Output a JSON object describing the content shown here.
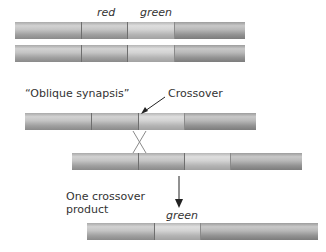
{
  "labels": {
    "red": "red",
    "green_top": "green",
    "oblique_synapsis": "“Oblique synapsis”",
    "crossover": "Crossover",
    "one_crossover_product_line1": "One crossover",
    "one_crossover_product_line2": "product",
    "green_bottom": "green"
  },
  "chromosomes": [
    {
      "name": "chromosome-1",
      "segments": [
        "flank-left",
        "red",
        "green",
        "flank-right"
      ]
    },
    {
      "name": "chromosome-2",
      "segments": [
        "flank-left",
        "red",
        "green",
        "flank-right"
      ]
    },
    {
      "name": "oblique-chromosome-top",
      "segments": [
        "flank-left",
        "red",
        "green",
        "flank-right"
      ]
    },
    {
      "name": "oblique-chromosome-bottom",
      "segments": [
        "flank-left",
        "red",
        "green",
        "flank-right"
      ]
    },
    {
      "name": "crossover-product",
      "segments": [
        "flank-left",
        "green",
        "flank-right"
      ]
    }
  ],
  "colors": {
    "bar_gray": "#b4b4b4",
    "segment_border": "#6e6e6e",
    "text": "#333333",
    "arrow": "#222222"
  }
}
